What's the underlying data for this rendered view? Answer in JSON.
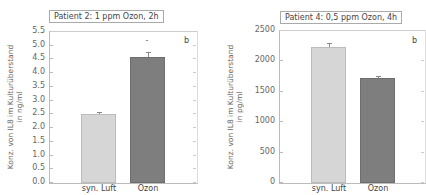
{
  "chart_data": [
    {
      "type": "bar",
      "title": "Patient 2: 1 ppm Ozon, 2h",
      "panel_label": "b",
      "ylabel_line1": "Konz. von IL8 im Kulturüberstand",
      "ylabel_line2": "in ng/ml",
      "xlabel": "",
      "categories": [
        "syn. Luft",
        "Ozon"
      ],
      "values": [
        2.5,
        4.6
      ],
      "errors": [
        0.05,
        0.15
      ],
      "significance": [
        "",
        "*"
      ],
      "ylim": [
        0.0,
        5.5
      ],
      "yticks": [
        "0.0",
        "0.5",
        "1.0",
        "1.5",
        "2.0",
        "2.5",
        "3.0",
        "3.5",
        "4.0",
        "4.5",
        "5.0",
        "5.5"
      ],
      "colors": [
        "#d6d6d6",
        "#7e7e7e"
      ],
      "grid": false
    },
    {
      "type": "bar",
      "title": "Patient 4: 0,5 ppm Ozon, 4h",
      "panel_label": "b",
      "ylabel_line1": "Konz. von IL8 im Kulturüberstand",
      "ylabel_line2": "in pg/ml",
      "xlabel": "",
      "categories": [
        "syn. Luft",
        "Ozon"
      ],
      "values": [
        2230,
        1730
      ],
      "errors": [
        50,
        20
      ],
      "significance": [
        "",
        ""
      ],
      "ylim": [
        0,
        2500
      ],
      "yticks": [
        "0",
        "500",
        "1000",
        "1500",
        "2000",
        "2500"
      ],
      "colors": [
        "#d6d6d6",
        "#7e7e7e"
      ],
      "grid": false
    }
  ]
}
